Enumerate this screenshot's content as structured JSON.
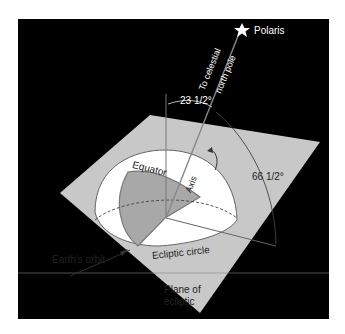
{
  "diagram": {
    "star_label": "Polaris",
    "pole_label_line1": "To celestial",
    "pole_label_line2": "north pole",
    "angle_small": "23 1/2°",
    "angle_large": "66 1/2°",
    "equator_label": "Equator",
    "axis_label": "Axis",
    "ecliptic_circle_label": "Ecliptic circle",
    "orbit_label": "Earth's orbit",
    "plane_label_line1": "Plane of",
    "plane_label_line2": "ecliptic"
  },
  "colors": {
    "background": "#000000",
    "plane": "#c8c8c8",
    "hemisphere": "#ffffff",
    "equator_fill": "#a8a8a8",
    "lines": "#555555"
  }
}
